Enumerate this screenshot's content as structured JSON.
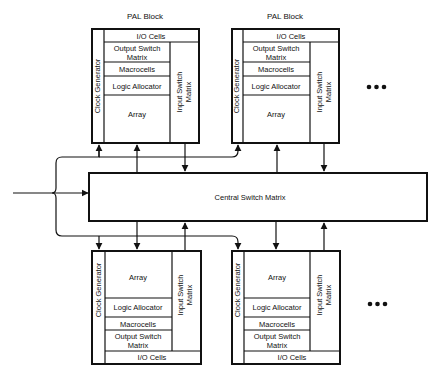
{
  "diagram": {
    "central_switch_matrix": {
      "label": "Central Switch Matrix"
    },
    "pal_blocks": [
      {
        "position": "top-left",
        "title": "PAL Block",
        "clock_generator": "Clock Generator",
        "input_switch_matrix": [
          "Input Switch",
          "Matrix"
        ],
        "io_cells": "I/O Cells",
        "output_switch_matrix": [
          "Output Switch",
          "Matrix"
        ],
        "macrocells": "Macrocells",
        "logic_allocator": "Logic Allocator",
        "array": "Array"
      },
      {
        "position": "top-right",
        "title": "PAL Block",
        "clock_generator": "Clock Generator",
        "input_switch_matrix": [
          "Input Switch",
          "Matrix"
        ],
        "io_cells": "I/O Cells",
        "output_switch_matrix": [
          "Output Switch",
          "Matrix"
        ],
        "macrocells": "Macrocells",
        "logic_allocator": "Logic Allocator",
        "array": "Array"
      },
      {
        "position": "bottom-left",
        "clock_generator": "Clock Generator",
        "input_switch_matrix": [
          "Input Switch",
          "Matrix"
        ],
        "io_cells": "I/O Cells",
        "output_switch_matrix": [
          "Output Switch",
          "Matrix"
        ],
        "macrocells": "Macrocells",
        "logic_allocator": "Logic Allocator",
        "array": "Array"
      },
      {
        "position": "bottom-right",
        "clock_generator": "Clock Generator",
        "input_switch_matrix": [
          "Input Switch",
          "Matrix"
        ],
        "io_cells": "I/O Cells",
        "output_switch_matrix": [
          "Output Switch",
          "Matrix"
        ],
        "macrocells": "Macrocells",
        "logic_allocator": "Logic Allocator",
        "array": "Array"
      }
    ],
    "continuation_marks": [
      "ellipsis-top",
      "ellipsis-bottom"
    ],
    "colors": {
      "line": "#111111",
      "background": "#ffffff"
    }
  }
}
